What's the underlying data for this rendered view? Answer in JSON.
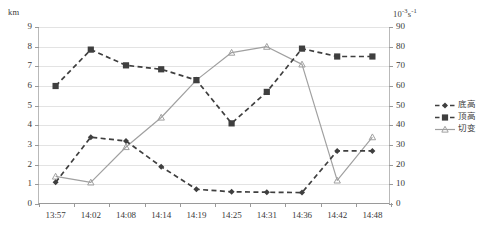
{
  "chart_data": {
    "type": "line",
    "title": "",
    "subtitle": "",
    "xlabel": "",
    "ylabel_left": "km",
    "ylabel_right": "10⁻³s⁻¹",
    "grid": true,
    "legend_position": "right",
    "categories": [
      "13:57",
      "14:02",
      "14:08",
      "14:14",
      "14:19",
      "14:25",
      "14:31",
      "14:36",
      "14:42",
      "14:48"
    ],
    "ylim_left": [
      0,
      9
    ],
    "ylim_right": [
      0,
      90
    ],
    "yticks_left": [
      0,
      1,
      2,
      3,
      4,
      5,
      6,
      7,
      8,
      9
    ],
    "yticks_right": [
      0,
      10,
      20,
      30,
      40,
      50,
      60,
      70,
      80,
      90
    ],
    "series": [
      {
        "name": "底高",
        "axis": "left",
        "marker": "diamond",
        "linestyle": "dashed",
        "color": "#3f3f3f",
        "values": [
          1.1,
          3.4,
          3.2,
          1.9,
          0.75,
          0.62,
          0.6,
          0.58,
          2.7,
          2.7
        ]
      },
      {
        "name": "顶高",
        "axis": "left",
        "marker": "square",
        "linestyle": "dashed",
        "color": "#3f3f3f",
        "values": [
          6.0,
          7.85,
          7.05,
          6.85,
          6.3,
          4.1,
          5.7,
          7.9,
          7.5,
          7.5
        ]
      },
      {
        "name": "切变",
        "axis": "right",
        "marker": "triangle",
        "linestyle": "solid",
        "color": "#a0a0a0",
        "values": [
          14,
          11,
          29,
          44,
          63,
          77,
          80,
          71,
          12,
          34
        ]
      }
    ]
  },
  "axes": {
    "left_unit": "km",
    "right_unit_base": "10",
    "right_unit_exp1": "-3",
    "right_unit_mid": "s",
    "right_unit_exp2": "-1"
  },
  "legend": {
    "items": [
      {
        "label": "底高",
        "marker": "diamond",
        "linestyle": "dashed",
        "color": "#3f3f3f"
      },
      {
        "label": "顶高",
        "marker": "square",
        "linestyle": "dashed",
        "color": "#3f3f3f"
      },
      {
        "label": "切变",
        "marker": "triangle",
        "linestyle": "solid",
        "color": "#a0a0a0"
      }
    ]
  }
}
